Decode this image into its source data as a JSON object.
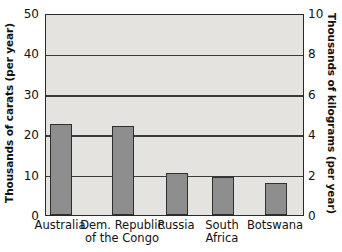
{
  "chart_data": {
    "type": "bar",
    "title": "",
    "categories": [
      "Australia",
      "Dem. Republic\nof the Congo",
      "Russia",
      "South\nAfrica",
      "Botswana"
    ],
    "values": [
      22.5,
      22.0,
      10.5,
      9.5,
      8.0
    ],
    "series": [
      {
        "name": "Thousands of carats (per year)",
        "values": [
          22.5,
          22.0,
          10.5,
          9.5,
          8.0
        ]
      }
    ],
    "xlabel": "",
    "ylabel": "Thousands of carats (per year)",
    "y2label": "Thousands of kilograms (per year)",
    "ylim": [
      0,
      50
    ],
    "y2lim": [
      0,
      10
    ],
    "yticks": [
      "0",
      "10",
      "20",
      "30",
      "40",
      "50"
    ],
    "ytick_values": [
      0,
      10,
      20,
      30,
      40,
      50
    ],
    "y2ticks": [
      "0",
      "2",
      "4",
      "6",
      "8",
      "10"
    ],
    "y2tick_values": [
      0,
      2,
      4,
      6,
      8,
      10
    ],
    "grid": true,
    "legend": "none",
    "colors": {
      "bar_fill": "#8e8e8e",
      "bar_stroke": "#2f2f2f",
      "plot_background": "#e4e3e0",
      "axis": "#2a2a2a",
      "gridline": "#3a3a3a",
      "text": "#111111"
    }
  },
  "axes": {
    "left_title": "Thousands of carats (per year)",
    "right_title": "Thousands of kilograms (per year)"
  }
}
